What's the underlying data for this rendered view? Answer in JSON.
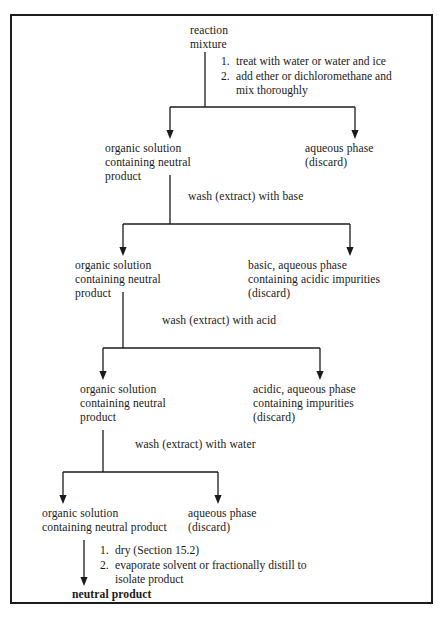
{
  "diagram": {
    "line_color": "#1b1b1b"
  },
  "nodes": {
    "start": "reaction\nmixture",
    "level1": {
      "left": "organic solution\ncontaining neutral\nproduct",
      "right": "aqueous phase\n(discard)"
    },
    "level2": {
      "left": "organic solution\ncontaining neutral\nproduct",
      "right": "basic, aqueous phase\ncontaining acidic impurities\n(discard)"
    },
    "level3": {
      "left": "organic solution\ncontaining neutral\nproduct",
      "right": "acidic, aqueous phase\ncontaining impurities\n(discard)"
    },
    "level4": {
      "left": "organic solution\ncontaining neutral product",
      "right": "aqueous phase\n(discard)"
    },
    "final": "neutral product"
  },
  "steps": {
    "first": {
      "items": [
        {
          "num": "1.",
          "text": "treat with water or water and ice"
        },
        {
          "num": "2.",
          "text": "add ether or dichloromethane and",
          "cont": "mix thoroughly"
        }
      ]
    },
    "wash_base": "wash (extract) with base",
    "wash_acid": "wash (extract) with acid",
    "wash_water": "wash (extract) with water",
    "last": {
      "items": [
        {
          "num": "1.",
          "text": "dry (Section 15.2)"
        },
        {
          "num": "2.",
          "text": "evaporate solvent or fractionally distill to",
          "cont": "isolate product"
        }
      ]
    }
  }
}
